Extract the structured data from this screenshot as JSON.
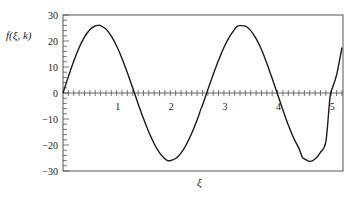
{
  "chart_data": {
    "type": "line",
    "title": "",
    "xlabel": "ξ",
    "ylabel": "f(ξ, k)",
    "xlim": [
      0,
      5.22
    ],
    "ylim": [
      -30,
      30
    ],
    "grid": false,
    "legend": null,
    "x_ticks": [
      1,
      2,
      3,
      4,
      5
    ],
    "x_tick_labels": [
      "1",
      "2",
      "3",
      "4",
      "5"
    ],
    "x_minor_tick_step": 0.1,
    "y_ticks": [
      30,
      20,
      10,
      0,
      -10,
      -20,
      -30
    ],
    "y_tick_labels": [
      "30",
      "20",
      "10",
      "0",
      "−10",
      "−20",
      "−30"
    ],
    "y_minor_tick_step": 2,
    "series": [
      {
        "name": "f(ξ, k)",
        "color": "#1a1a1a",
        "x": [
          0,
          0.1,
          0.2,
          0.3,
          0.4,
          0.5,
          0.6,
          0.66,
          0.7,
          0.8,
          0.9,
          1.0,
          1.1,
          1.2,
          1.3,
          1.4,
          1.5,
          1.6,
          1.7,
          1.8,
          1.9,
          1.95,
          2.0,
          2.1,
          2.2,
          2.3,
          2.4,
          2.5,
          2.57,
          2.6,
          2.7,
          2.8,
          2.9,
          3.0,
          3.1,
          3.2,
          3.24,
          3.3,
          3.4,
          3.5,
          3.6,
          3.7,
          3.8,
          3.85,
          3.9,
          4.0,
          4.1,
          4.2,
          4.3,
          4.4,
          4.46,
          4.5,
          4.6,
          4.7,
          4.8,
          4.9,
          4.97,
          5.0,
          5.1,
          5.2
        ],
        "y": [
          0,
          6.3,
          12.2,
          17.4,
          21.5,
          24.3,
          25.8,
          26.0,
          25.9,
          24.6,
          21.9,
          18.1,
          13.3,
          7.8,
          1.9,
          -4.1,
          -9.8,
          -15.0,
          -19.5,
          -23.0,
          -25.3,
          -26.0,
          -26.0,
          -25.2,
          -23.1,
          -19.8,
          -15.5,
          -10.4,
          -6.2,
          -4.7,
          1.3,
          7.1,
          12.6,
          17.5,
          21.5,
          24.5,
          25.5,
          25.9,
          25.7,
          24.0,
          20.9,
          16.7,
          11.4,
          8.5,
          5.6,
          -0.5,
          -6.5,
          -12.3,
          -17.3,
          -21.4,
          -24.6,
          -25.3,
          -26.3,
          -25.4,
          -22.8,
          -18.7,
          -3.2,
          0.6,
          6.9,
          17.5
        ]
      }
    ]
  },
  "figure": {
    "y_axis_label": "f(ξ, k)",
    "x_axis_label": "ξ"
  }
}
